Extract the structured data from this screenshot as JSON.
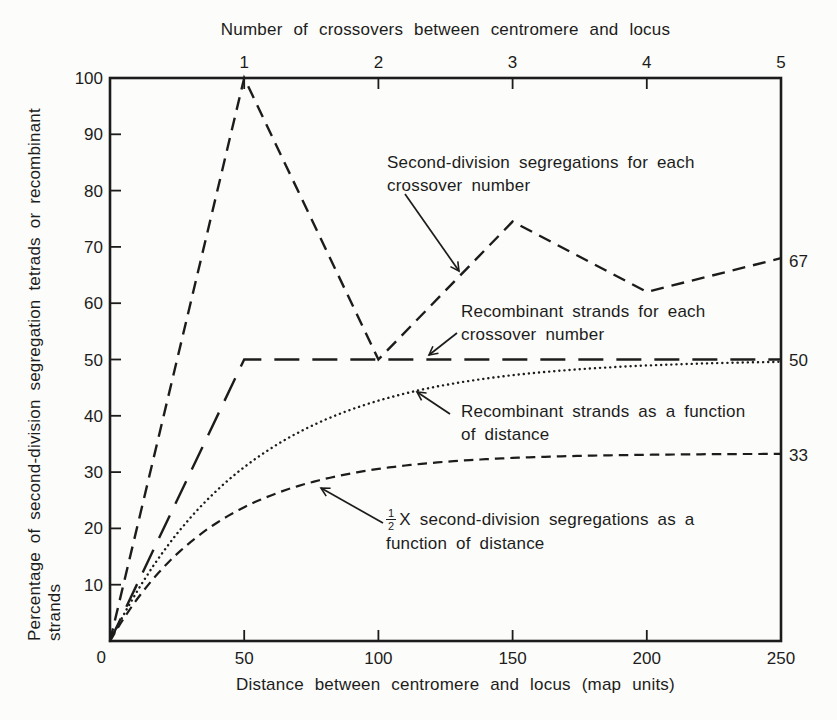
{
  "figure": {
    "background": "#fcfcfa",
    "ink": "#1c1c1c"
  },
  "chart_data": {
    "type": "line",
    "top_axis_title": "Number of crossovers between centromere and locus",
    "xlabel": "Distance between centromere and locus (map units)",
    "ylabel_line1": "Percentage of second-division segregation tetrads or recombinant",
    "ylabel_line2": "strands",
    "x_axis": {
      "min": 0,
      "max": 250,
      "ticks": [
        0,
        50,
        100,
        150,
        200,
        250
      ]
    },
    "top_axis": {
      "ticks": [
        "1",
        "2",
        "3",
        "4",
        "5"
      ],
      "positions": [
        50,
        100,
        150,
        200,
        250
      ]
    },
    "y_axis": {
      "min": 0,
      "max": 100,
      "ticks": [
        100,
        90,
        80,
        70,
        60,
        50,
        40,
        30,
        20,
        10,
        0
      ]
    },
    "origin_label": "0",
    "right_value_labels": [
      {
        "text": "67",
        "y": 67.5
      },
      {
        "text": "50",
        "y": 50
      },
      {
        "text": "33",
        "y": 33
      }
    ],
    "series": [
      {
        "id": "second-division-segregations-per-crossover-number",
        "style": "dash-medium",
        "points": [
          [
            0,
            0
          ],
          [
            50,
            100
          ],
          [
            100,
            50
          ],
          [
            150,
            74.5
          ],
          [
            200,
            62
          ],
          [
            250,
            68
          ]
        ]
      },
      {
        "id": "recombinant-strands-per-crossover-number",
        "style": "dash-long",
        "points": [
          [
            0,
            0
          ],
          [
            50,
            50
          ],
          [
            250,
            50
          ]
        ]
      },
      {
        "id": "recombinant-strands-vs-distance",
        "style": "dotted",
        "curve": "asymptotic",
        "asymptote": 50,
        "rate": 52
      },
      {
        "id": "half-second-division-segregations-vs-distance",
        "style": "dash-short",
        "curve": "asymptotic",
        "asymptote": 33.3,
        "rate": 40
      }
    ],
    "annotations": [
      {
        "id": "sds-per-crossover-label",
        "lines": [
          "Second-division segregations for each",
          "crossover number"
        ],
        "label_px": {
          "x": 387,
          "y": 151
        },
        "arrow_px": {
          "x1": 405,
          "y1": 194,
          "x2": 459,
          "y2": 271
        }
      },
      {
        "id": "recombinant-per-crossover-label",
        "lines": [
          "Recombinant strands for each",
          "crossover number"
        ],
        "label_px": {
          "x": 461,
          "y": 300
        },
        "arrow_px": {
          "x1": 457,
          "y1": 333,
          "x2": 429,
          "y2": 355
        }
      },
      {
        "id": "recombinant-vs-distance-label",
        "lines": [
          "Recombinant strands as a function",
          "of distance"
        ],
        "label_px": {
          "x": 461,
          "y": 400
        },
        "arrow_px": {
          "x1": 450,
          "y1": 414,
          "x2": 417,
          "y2": 392
        }
      },
      {
        "id": "half-sds-vs-distance-label",
        "fraction": {
          "numerator": "1",
          "denominator": "2"
        },
        "lines": [
          "X second-division segregations as a",
          "function of distance"
        ],
        "label_px": {
          "x": 386,
          "y": 508
        },
        "arrow_px": {
          "x1": 383,
          "y1": 523,
          "x2": 321,
          "y2": 488
        }
      }
    ]
  }
}
